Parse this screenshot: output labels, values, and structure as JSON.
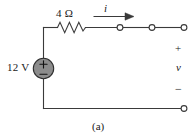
{
  "figure": {
    "caption": "(a)",
    "background_color": "#ffffff",
    "line_color": "#3a3a3a",
    "text_color": "#1a1a1a",
    "source_fill_color": "#8c8c8c",
    "terminal_fill_color": "#ffffff",
    "width": 196,
    "height": 139
  },
  "labels": {
    "resistor": "4 Ω",
    "current": "i",
    "source": "12 V",
    "terminal_plus": "+",
    "voltage": "v",
    "terminal_minus": "−"
  },
  "components": {
    "resistor": {
      "name": "resistor-4-ohm",
      "value": "4 Ω",
      "orientation": "horizontal",
      "zigzag_peaks": 6
    },
    "voltage_source": {
      "name": "dc-voltage-source-12v",
      "value": "12 V",
      "symbol": "circle-with-plus-minus",
      "polarity_top": "+",
      "polarity_bottom": "−"
    },
    "current_arrow": {
      "name": "current-arrow-i",
      "symbol": "i",
      "direction": "right"
    },
    "terminals": [
      {
        "name": "terminal-top-1",
        "state": "open"
      },
      {
        "name": "terminal-top-2",
        "state": "open"
      },
      {
        "name": "terminal-top-right",
        "state": "open"
      },
      {
        "name": "terminal-bottom-right",
        "state": "open"
      }
    ]
  }
}
